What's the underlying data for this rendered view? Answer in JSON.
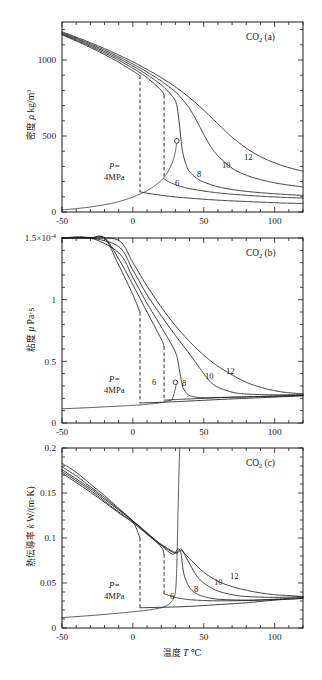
{
  "figure": {
    "substance": "CO2",
    "xaxis": {
      "label_cjk": "温度",
      "label_symbol": "T",
      "label_unit": "℃",
      "min": -50,
      "max": 120,
      "ticks": [
        -50,
        0,
        50,
        100
      ],
      "tick_labels": [
        "-50",
        "0",
        "50",
        "100"
      ],
      "minor_step": 10
    },
    "pressures_mpa": [
      4,
      6,
      8,
      10,
      12
    ],
    "pressure_annotation_line1": "P=",
    "pressure_annotation_line2": "4MPa",
    "curve_labels": [
      "6",
      "8",
      "10",
      "12"
    ],
    "critical_marker": "open-circle"
  },
  "panels": [
    {
      "id": "a",
      "corner_species": "CO",
      "corner_species_sub": "2",
      "corner_tag": "(a)",
      "ylabel_cjk": "密度",
      "ylabel_symbol": "ρ",
      "ylabel_unit": "kg/m",
      "ylabel_unit_sup": "3",
      "ymin": 0,
      "ymax": 1250,
      "yticks": [
        0,
        500,
        1000
      ],
      "ytick_labels": [
        "0",
        "500",
        "1000"
      ],
      "yminor_step": 100
    },
    {
      "id": "b",
      "corner_species": "CO",
      "corner_species_sub": "2",
      "corner_tag": "(b)",
      "ylabel_cjk": "粘度",
      "ylabel_symbol": "μ",
      "ylabel_unit": "Pa·s",
      "ymin": 0,
      "ymax": 1.5,
      "yticks": [
        0,
        0.5,
        1,
        1.5
      ],
      "ytick_labels": [
        "0",
        "0.5",
        "1",
        "1.5×10"
      ],
      "ytop_exponent": "-4",
      "yminor_step": 0.1
    },
    {
      "id": "c",
      "corner_species": "CO",
      "corner_species_sub": "2",
      "corner_tag": "(c)",
      "ylabel_cjk": "熱伝導率",
      "ylabel_symbol": "k",
      "ylabel_unit": "W/(m·K)",
      "ymin": 0,
      "ymax": 0.2,
      "yticks": [
        0,
        0.05,
        0.1,
        0.15,
        0.2
      ],
      "ytick_labels": [
        "0",
        "0.05",
        "0.1",
        "0.15",
        "0.2"
      ],
      "yminor_step": 0.01
    }
  ],
  "chart_data": {
    "type": "line",
    "xlabel": "温度 T ℃",
    "x": [
      -50,
      -40,
      -30,
      -20,
      -10,
      0,
      5,
      10,
      20,
      21,
      22,
      25,
      28,
      30,
      31,
      32,
      33,
      35,
      38,
      40,
      45,
      50,
      55,
      60,
      70,
      80,
      90,
      100,
      110,
      120
    ],
    "panels": [
      {
        "id": "a",
        "ylabel": "密度 ρ kg/m3",
        "ylim": [
          0,
          1250
        ],
        "series": [
          {
            "name": "4",
            "pressure_mpa": 4,
            "liquid_x": [
              -50,
              -40,
              -30,
              -20,
              -10,
              0,
              5
            ],
            "liquid_y": [
              1165,
              1125,
              1082,
              1036,
              985,
              928,
              897
            ],
            "vapor_x": [
              5,
              10,
              20,
              30,
              40,
              50,
              60,
              70,
              80,
              90,
              100,
              110,
              120
            ],
            "vapor_y": [
              133,
              124,
              110,
              99,
              91,
              84,
              78,
              73,
              69,
              65,
              61,
              58,
              56
            ],
            "dashed_transition_t": 5
          },
          {
            "name": "6",
            "pressure_mpa": 6,
            "liquid_x": [
              -50,
              -40,
              -30,
              -20,
              -10,
              0,
              10,
              20,
              22
            ],
            "liquid_y": [
              1170,
              1131,
              1090,
              1046,
              998,
              945,
              884,
              800,
              770
            ],
            "vapor_x": [
              22,
              25,
              30,
              35,
              40,
              50,
              60,
              70,
              80,
              90,
              100,
              110,
              120
            ],
            "vapor_y": [
              218,
              200,
              180,
              165,
              154,
              138,
              126,
              117,
              110,
              104,
              99,
              95,
              91
            ],
            "dashed_transition_t": 22
          },
          {
            "name": "8",
            "pressure_mpa": 8,
            "x": [
              -50,
              -40,
              -30,
              -20,
              -10,
              0,
              10,
              20,
              28,
              31,
              33,
              35,
              38,
              40,
              45,
              50,
              60,
              70,
              80,
              90,
              100,
              110,
              120
            ],
            "y": [
              1175,
              1138,
              1098,
              1056,
              1010,
              960,
              903,
              836,
              760,
              700,
              560,
              400,
              300,
              265,
              222,
              197,
              166,
              148,
              136,
              127,
              120,
              114,
              109
            ]
          },
          {
            "name": "10",
            "pressure_mpa": 10,
            "x": [
              -50,
              -40,
              -30,
              -20,
              -10,
              0,
              10,
              20,
              30,
              35,
              40,
              45,
              50,
              55,
              60,
              70,
              80,
              90,
              100,
              110,
              120
            ],
            "y": [
              1180,
              1144,
              1106,
              1065,
              1021,
              974,
              921,
              862,
              790,
              740,
              680,
              600,
              510,
              430,
              370,
              288,
              242,
              213,
              192,
              177,
              165
            ]
          },
          {
            "name": "12",
            "pressure_mpa": 12,
            "x": [
              -50,
              -40,
              -30,
              -20,
              -10,
              0,
              10,
              20,
              30,
              40,
              50,
              55,
              60,
              65,
              70,
              80,
              90,
              100,
              110,
              120
            ],
            "y": [
              1186,
              1151,
              1114,
              1075,
              1033,
              988,
              938,
              884,
              823,
              752,
              670,
              625,
              580,
              535,
              492,
              420,
              364,
              323,
              292,
              268
            ]
          }
        ],
        "saturation_curve": {
          "x": [
            -50,
            -40,
            -30,
            -20,
            -10,
            0,
            5,
            10,
            15,
            20,
            22,
            25,
            28,
            30,
            31
          ],
          "y": [
            14,
            22,
            33,
            48,
            68,
            98,
            118,
            140,
            170,
            208,
            228,
            270,
            330,
            400,
            468
          ],
          "critical_point": {
            "t": 31,
            "rho": 468
          }
        }
      },
      {
        "id": "b",
        "ylabel": "粘度 μ Pa·s",
        "ylim": [
          0,
          1.5
        ],
        "unit_scale": "1e-4",
        "series": [
          {
            "name": "4",
            "pressure_mpa": 4,
            "liquid_x": [
              -50,
              -40,
              -30,
              -20,
              -10,
              0,
              5
            ],
            "liquid_y": [
              2.4,
              2.05,
              1.75,
              1.5,
              1.28,
              1.04,
              0.9
            ],
            "vapor_x": [
              5,
              20,
              40,
              60,
              80,
              100,
              120
            ],
            "vapor_y": [
              0.163,
              0.168,
              0.178,
              0.19,
              0.2,
              0.21,
              0.22
            ],
            "dashed_transition_t": 5
          },
          {
            "name": "6",
            "pressure_mpa": 6,
            "liquid_x": [
              -50,
              -40,
              -30,
              -20,
              -10,
              0,
              10,
              20,
              22
            ],
            "liquid_y": [
              2.45,
              2.1,
              1.8,
              1.55,
              1.33,
              1.12,
              0.9,
              0.68,
              0.62
            ],
            "vapor_x": [
              22,
              30,
              40,
              60,
              80,
              100,
              120
            ],
            "vapor_y": [
              0.185,
              0.19,
              0.195,
              0.205,
              0.212,
              0.218,
              0.223
            ],
            "dashed_transition_t": 22
          },
          {
            "name": "8",
            "pressure_mpa": 8,
            "x": [
              -50,
              -30,
              -10,
              0,
              10,
              20,
              28,
              31,
              33,
              35,
              38,
              42,
              50,
              60,
              80,
              100,
              120
            ],
            "y": [
              2.5,
              1.85,
              1.38,
              1.18,
              0.97,
              0.78,
              0.62,
              0.54,
              0.42,
              0.3,
              0.24,
              0.215,
              0.205,
              0.207,
              0.212,
              0.218,
              0.225
            ]
          },
          {
            "name": "10",
            "pressure_mpa": 10,
            "x": [
              -50,
              -30,
              -10,
              0,
              10,
              20,
              30,
              40,
              45,
              50,
              55,
              60,
              70,
              80,
              100,
              120
            ],
            "y": [
              2.55,
              1.9,
              1.43,
              1.24,
              1.04,
              0.87,
              0.71,
              0.56,
              0.48,
              0.4,
              0.33,
              0.29,
              0.25,
              0.235,
              0.228,
              0.23
            ]
          },
          {
            "name": "12",
            "pressure_mpa": 12,
            "x": [
              -50,
              -30,
              -10,
              0,
              10,
              20,
              30,
              40,
              50,
              60,
              70,
              80,
              90,
              100,
              110,
              120
            ],
            "y": [
              2.6,
              1.95,
              1.48,
              1.3,
              1.11,
              0.94,
              0.79,
              0.66,
              0.55,
              0.46,
              0.39,
              0.33,
              0.29,
              0.262,
              0.245,
              0.238
            ]
          }
        ],
        "saturation_curve": {
          "x": [
            -50,
            -30,
            -10,
            0,
            10,
            20,
            25,
            28,
            31
          ],
          "y": [
            0.115,
            0.125,
            0.137,
            0.143,
            0.152,
            0.165,
            0.18,
            0.2,
            0.33
          ],
          "critical_point": {
            "t": 30,
            "mu": 0.33
          }
        }
      },
      {
        "id": "c",
        "ylabel": "熱伝導率 k W/(m·K)",
        "ylim": [
          0,
          0.2
        ],
        "series": [
          {
            "name": "4",
            "pressure_mpa": 4,
            "liquid_x": [
              -50,
              -40,
              -30,
              -20,
              -10,
              0,
              5
            ],
            "liquid_y": [
              0.183,
              0.173,
              0.16,
              0.147,
              0.133,
              0.118,
              0.1
            ],
            "vapor_x": [
              5,
              20,
              40,
              60,
              80,
              100,
              120
            ],
            "vapor_y": [
              0.0225,
              0.023,
              0.024,
              0.026,
              0.028,
              0.031,
              0.033
            ],
            "dashed_transition_t": 5
          },
          {
            "name": "6",
            "pressure_mpa": 6,
            "liquid_x": [
              -50,
              -40,
              -30,
              -20,
              -10,
              0,
              10,
              20,
              22
            ],
            "liquid_y": [
              0.179,
              0.169,
              0.157,
              0.145,
              0.132,
              0.119,
              0.105,
              0.09,
              0.082
            ],
            "vapor_x": [
              22,
              30,
              35,
              40,
              50,
              60,
              80,
              100,
              120
            ],
            "vapor_y": [
              0.038,
              0.034,
              0.0325,
              0.0315,
              0.0305,
              0.0302,
              0.0305,
              0.0315,
              0.0328
            ],
            "dashed_transition_t": 22
          },
          {
            "name": "8",
            "pressure_mpa": 8,
            "x": [
              -50,
              -30,
              -10,
              0,
              10,
              20,
              28,
              32,
              34,
              36,
              40,
              45,
              50,
              60,
              80,
              100,
              120
            ],
            "y": [
              0.176,
              0.155,
              0.131,
              0.119,
              0.106,
              0.092,
              0.082,
              0.088,
              0.082,
              0.06,
              0.045,
              0.038,
              0.035,
              0.032,
              0.031,
              0.032,
              0.034
            ]
          },
          {
            "name": "10",
            "pressure_mpa": 10,
            "x": [
              -50,
              -30,
              -10,
              0,
              10,
              20,
              30,
              34,
              38,
              45,
              50,
              55,
              60,
              70,
              80,
              100,
              120
            ],
            "y": [
              0.174,
              0.153,
              0.129,
              0.118,
              0.105,
              0.093,
              0.084,
              0.088,
              0.077,
              0.058,
              0.05,
              0.045,
              0.041,
              0.037,
              0.035,
              0.034,
              0.035
            ]
          },
          {
            "name": "12",
            "pressure_mpa": 12,
            "x": [
              -50,
              -30,
              -10,
              0,
              10,
              20,
              30,
              34,
              40,
              50,
              60,
              70,
              80,
              90,
              100,
              110,
              120
            ],
            "y": [
              0.172,
              0.151,
              0.128,
              0.117,
              0.104,
              0.092,
              0.083,
              0.086,
              0.077,
              0.062,
              0.052,
              0.046,
              0.042,
              0.039,
              0.037,
              0.036,
              0.035
            ]
          }
        ],
        "saturation_curve": {
          "x": [
            -50,
            -30,
            -10,
            0,
            10,
            20,
            25,
            28,
            30,
            31,
            32,
            33
          ],
          "y": [
            0.0115,
            0.0138,
            0.0165,
            0.018,
            0.0198,
            0.0225,
            0.026,
            0.031,
            0.04,
            0.07,
            0.14,
            0.2
          ],
          "critical_divergence_t": 31
        }
      }
    ]
  }
}
